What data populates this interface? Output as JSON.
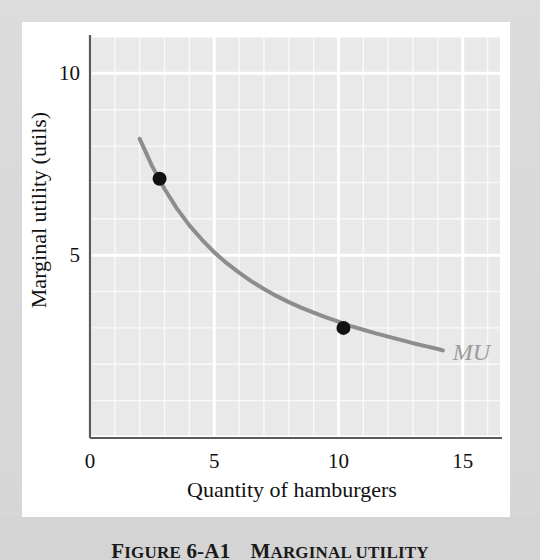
{
  "figure": {
    "caption_label": "Figure",
    "caption_number": "6-A1",
    "caption_title": "Marginal utility",
    "caption_full": "FIGURE 6-A1   MARGINAL UTILITY"
  },
  "chart_data": {
    "type": "line",
    "title": "",
    "xlabel": "Quantity of hamburgers",
    "ylabel": "Marginal utility (utils)",
    "xlim": [
      0,
      16.5
    ],
    "ylim": [
      0,
      11.0
    ],
    "xticks": [
      0,
      5,
      10,
      15
    ],
    "xticklabels": [
      "0",
      "5",
      "10",
      "15"
    ],
    "yticks": [
      5,
      10
    ],
    "yticklabels": [
      "5",
      "10"
    ],
    "grid": true,
    "grid_color": "#ffffff",
    "panel_color": "#e9e9e9",
    "legend": "none",
    "series": [
      {
        "name": "MU",
        "label": "MU",
        "label_color": "#9b9b9b",
        "color": "#8d8d8d",
        "linewidth": 4,
        "x": [
          2.0,
          2.5,
          3.0,
          3.5,
          4.0,
          4.5,
          5.0,
          5.5,
          6.0,
          6.5,
          7.0,
          7.5,
          8.0,
          8.5,
          9.0,
          9.5,
          10.0,
          10.5,
          11.0,
          11.5,
          12.0,
          12.5,
          13.0,
          13.5,
          14.0,
          14.2
        ],
        "y": [
          8.2,
          7.45,
          6.82,
          6.28,
          5.82,
          5.43,
          5.08,
          4.78,
          4.52,
          4.28,
          4.07,
          3.88,
          3.71,
          3.56,
          3.42,
          3.29,
          3.17,
          3.05,
          2.95,
          2.85,
          2.76,
          2.67,
          2.58,
          2.5,
          2.42,
          2.38
        ]
      }
    ],
    "points": [
      {
        "name": "point-a",
        "x": 2.8,
        "y": 7.1,
        "color": "#111111",
        "radius": 7
      },
      {
        "name": "point-b",
        "x": 10.2,
        "y": 3.0,
        "color": "#111111",
        "radius": 7
      }
    ],
    "annotations": [
      {
        "name": "mu-curve-label",
        "text": "MU",
        "x": 14.6,
        "y": 2.25
      }
    ]
  }
}
